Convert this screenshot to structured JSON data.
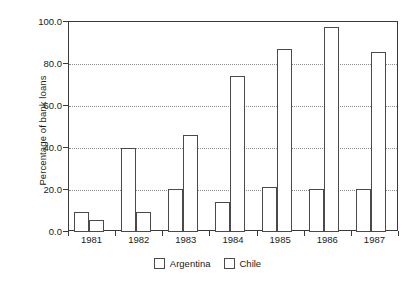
{
  "chart_data": {
    "type": "bar",
    "title": "",
    "xlabel": "",
    "ylabel": "Percentage of bank loans",
    "categories": [
      "1981",
      "1982",
      "1983",
      "1984",
      "1985",
      "1986",
      "1987"
    ],
    "series": [
      {
        "name": "Argentina",
        "values": [
          9.5,
          39.8,
          20.3,
          14.2,
          21.2,
          20.4,
          20.4
        ]
      },
      {
        "name": "Chile",
        "values": [
          5.8,
          9.6,
          46.3,
          74.2,
          87.0,
          97.5,
          85.6
        ]
      }
    ],
    "ylim": [
      0.0,
      100.0
    ],
    "ytick_labels": [
      "0.0",
      "20.0",
      "40.0",
      "60.0",
      "80.0",
      "100.0"
    ],
    "ytick_values": [
      0,
      20,
      40,
      60,
      80,
      100
    ],
    "grid": true,
    "grid_style": "dotted",
    "legend_position": "bottom-center",
    "bar_fill": "#ffffff",
    "bar_edge": "#4a4a4a",
    "axis_color": "#3a3a3a",
    "grid_color": "#8d8d8d",
    "background": "#ffffff"
  },
  "legend": {
    "items": [
      {
        "label": "Argentina"
      },
      {
        "label": "Chile"
      }
    ]
  }
}
